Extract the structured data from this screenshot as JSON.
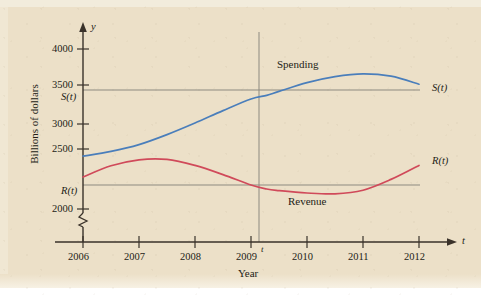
{
  "figure": {
    "background_color": "#ece0c8",
    "axis_color": "#3a322a",
    "guide_line_color": "#8d8a80"
  },
  "axes": {
    "y_axis_label": "y",
    "x_axis_label": "t",
    "y_axis_title": "Billions of dollars",
    "x_axis_title": "Year",
    "y_ticks": [
      "2000",
      "2500",
      "3000",
      "3500",
      "4000"
    ],
    "x_ticks": [
      "2006",
      "2007",
      "2008",
      "2009",
      "2010",
      "2011",
      "2012"
    ],
    "y_break_symbol": "axis-break-zigzag",
    "t_marker_label": "t"
  },
  "guides": {
    "s_of_t_label": "S(t)",
    "r_of_t_label": "R(t)"
  },
  "curve_end_labels": {
    "spending": "S(t)",
    "revenue": "R(t)"
  },
  "series_labels": {
    "spending": "Spending",
    "revenue": "Revenue"
  },
  "chart_data": {
    "type": "line",
    "title": "",
    "xlabel": "Year",
    "ylabel": "Billions of dollars",
    "xlim": [
      2006,
      2012
    ],
    "ylim": [
      1900,
      4150
    ],
    "grid": false,
    "legend": "inline-annotations",
    "x_tick_labels": [
      "2006",
      "2007",
      "2008",
      "2009",
      "2010",
      "2011",
      "2012"
    ],
    "y_tick_labels": [
      "2000",
      "2500",
      "3000",
      "3500",
      "4000"
    ],
    "axis_break": {
      "axis": "y",
      "below": 2000
    },
    "annotations": [
      {
        "text": "Spending",
        "x": 2009.55,
        "y": 3830,
        "series": "spending"
      },
      {
        "text": "Revenue",
        "x": 2010.1,
        "y": 2080,
        "series": "revenue"
      },
      {
        "text": "S(t)",
        "x": 2012.25,
        "y": 3530,
        "kind": "curve-end-label"
      },
      {
        "text": "R(t)",
        "x": 2012.25,
        "y": 2600,
        "kind": "curve-end-label"
      },
      {
        "text": "S(t)",
        "x": 2005.72,
        "y": 3355,
        "kind": "axis-value-label"
      },
      {
        "text": "R(t)",
        "x": 2005.72,
        "y": 2190,
        "kind": "axis-value-label"
      },
      {
        "text": "t",
        "x": 2009.37,
        "y": 1935,
        "kind": "axis-value-label"
      }
    ],
    "reference_lines": [
      {
        "orientation": "vertical",
        "x": 2009.28,
        "label": "t",
        "from_y": 1980,
        "to_y": 4000
      },
      {
        "orientation": "horizontal",
        "y": 3420,
        "label": "S(t)",
        "from_x": 2006,
        "to_x": 2012
      },
      {
        "orientation": "horizontal",
        "y": 2250,
        "label": "R(t)",
        "from_x": 2006,
        "to_x": 2012
      }
    ],
    "series": [
      {
        "name": "Spending",
        "symbol": "S(t)",
        "color": "#4a7ebb",
        "x": [
          2006,
          2006.5,
          2007,
          2007.5,
          2008,
          2008.5,
          2009,
          2009.28,
          2009.5,
          2010,
          2010.5,
          2011,
          2011.5,
          2012
        ],
        "values": [
          2660,
          2720,
          2805,
          2930,
          3075,
          3230,
          3375,
          3420,
          3470,
          3580,
          3655,
          3690,
          3660,
          3560
        ]
      },
      {
        "name": "Revenue",
        "symbol": "R(t)",
        "color": "#d04a5a",
        "x": [
          2006,
          2006.5,
          2007,
          2007.5,
          2008,
          2008.5,
          2009,
          2009.28,
          2009.5,
          2010,
          2010.5,
          2011,
          2011.5,
          2012
        ],
        "values": [
          2400,
          2540,
          2615,
          2620,
          2545,
          2430,
          2300,
          2250,
          2230,
          2200,
          2190,
          2235,
          2370,
          2545
        ]
      }
    ],
    "intersection_points": [
      {
        "series": "Spending",
        "x": 2009.28,
        "y": 3420
      },
      {
        "series": "Revenue",
        "x": 2009.28,
        "y": 2250
      }
    ]
  }
}
